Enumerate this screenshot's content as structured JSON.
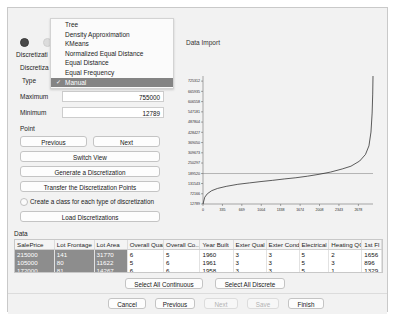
{
  "window": {
    "title": "Discretization Wizard"
  },
  "left_panel": {
    "radio_a": {
      "name": "discretization-mode-a",
      "selected": true
    },
    "radio_b": {
      "name": "discretization-mode-b",
      "selected": false
    },
    "labels": {
      "discretization_1": "Discretizati",
      "discretization_2": "Discretiza",
      "type": "Type"
    },
    "type_dropdown": {
      "selected": "Manual",
      "check_glyph": "✓",
      "options": [
        "Tree",
        "Density Approximation",
        "KMeans",
        "Normalized Equal Distance",
        "Equal Distance",
        "Equal Frequency",
        "Manual"
      ]
    },
    "fields": [
      {
        "label": "Maximum",
        "value": "755000",
        "has_input": true
      },
      {
        "label": "Minimum",
        "value": "12789",
        "has_input": true
      },
      {
        "label": "Point",
        "value": "",
        "has_input": false
      }
    ],
    "buttons": {
      "previous": "Previous",
      "next": "Next",
      "switch_view": "Switch View",
      "generate": "Generate a Discretization",
      "transfer": "Transfer the Discretization Points",
      "load": "Load Discretizations"
    },
    "checkbox": {
      "label": "Create a class for each type of discretization",
      "checked": false
    }
  },
  "right_panel": {
    "import_label": "Data Import"
  },
  "chart_data": {
    "type": "line",
    "title": "",
    "xlabel": "",
    "ylabel": "",
    "xlim": [
      0,
      2930
    ],
    "ylim": [
      12789,
      755000
    ],
    "grid": false,
    "legend": null,
    "xticks": [
      0,
      335,
      669,
      1004,
      1338,
      1674,
      2008,
      2343,
      2678
    ],
    "xticklabels": [
      "0",
      "335",
      "669",
      "1004",
      "1338",
      "1674",
      "2008",
      "2343",
      "2678"
    ],
    "yticks": [
      12789,
      72166,
      131543,
      189520,
      250297,
      309673,
      369050,
      428427,
      487804,
      547181,
      606558,
      665935,
      725312
    ],
    "yticklabels": [
      "12789",
      "72166",
      "131543",
      "189520",
      "250297",
      "309673",
      "369050",
      "428427",
      "487804",
      "547181",
      "606558",
      "665935",
      "725312"
    ],
    "reference_line": {
      "y": 189520,
      "orientation": "horizontal"
    },
    "series": [
      {
        "name": "SalePrice sorted",
        "x": [
          0,
          30,
          75,
          150,
          250,
          400,
          600,
          800,
          1000,
          1200,
          1400,
          1600,
          1800,
          2000,
          2200,
          2400,
          2550,
          2700,
          2800,
          2860,
          2895,
          2915,
          2925,
          2930
        ],
        "y": [
          12789,
          52000,
          72166,
          90000,
          103000,
          115000,
          127000,
          135000,
          143000,
          150000,
          158000,
          165000,
          174000,
          185000,
          198000,
          216000,
          232000,
          262000,
          300000,
          350000,
          430000,
          540000,
          650000,
          755000
        ]
      }
    ]
  },
  "data_section": {
    "label": "Data",
    "columns": [
      "SalePrice",
      "Lot Frontage",
      "Lot Area",
      "Overall Qual",
      "Overall Co...",
      "Year Built",
      "Exter Qual",
      "Exter Cond",
      "Electrical",
      "Heating QC",
      "1st Fl"
    ],
    "rows": [
      {
        "selected_first_cell": true,
        "cells": [
          "215000",
          "141",
          "31770",
          "6",
          "5",
          "1960",
          "3",
          "3",
          "5",
          "2",
          "1656"
        ]
      },
      {
        "selected_first_cell": true,
        "cells": [
          "105000",
          "80",
          "11622",
          "5",
          "6",
          "1961",
          "3",
          "3",
          "5",
          "3",
          "896"
        ]
      },
      {
        "selected_first_cell": true,
        "cells": [
          "172000",
          "81",
          "14267",
          "6",
          "6",
          "1958",
          "3",
          "3",
          "5",
          "1",
          "1329"
        ]
      }
    ],
    "select_all_continuous": "Select All Continuous",
    "select_all_discrete": "Select All Discrete"
  },
  "footer": {
    "cancel": "Cancel",
    "previous": "Previous",
    "next": "Next",
    "save": "Save",
    "finish": "Finish",
    "next_disabled": true,
    "save_disabled": true
  }
}
